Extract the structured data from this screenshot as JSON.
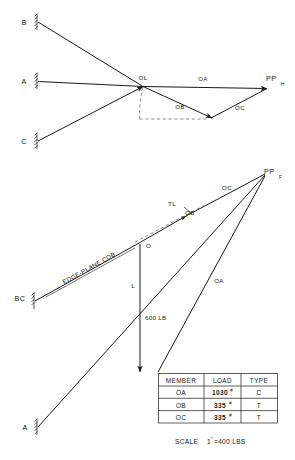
{
  "diagram": {
    "top_view": {
      "name": "horizontal-projection",
      "supports": [
        {
          "id": "support-b",
          "label": "B"
        },
        {
          "id": "support-a",
          "label": "A"
        },
        {
          "id": "support-c",
          "label": "C"
        }
      ],
      "junction_label": "OL",
      "vectors": [
        {
          "id": "vector-oa",
          "label": "OA"
        },
        {
          "id": "vector-ob",
          "label": "OB"
        },
        {
          "id": "vector-oc",
          "label": "OC"
        }
      ],
      "point_label": "PP",
      "point_subscript": "H"
    },
    "bottom_view": {
      "name": "frontal-projection",
      "supports": [
        {
          "id": "support-bc",
          "label": "BC"
        },
        {
          "id": "support-a-lower",
          "label": "A"
        }
      ],
      "edge_plane_label": "EDGE-PLANE COB",
      "origin_label": "O",
      "true_length_label": "TL",
      "vectors": [
        {
          "id": "vector-ob-lower",
          "label": "OB"
        },
        {
          "id": "vector-oc-lower",
          "label": "OC"
        },
        {
          "id": "vector-oa-lower",
          "label": "OA"
        },
        {
          "id": "vector-load",
          "label": "L"
        }
      ],
      "load_label": "600 LB",
      "point_label": "PP",
      "point_subscript": "F"
    }
  },
  "table": {
    "name": "member-load-table",
    "headers": [
      "MEMBER",
      "LOAD",
      "TYPE"
    ],
    "rows": [
      {
        "member": "OA",
        "load": "1030",
        "load_unit": "#",
        "type": "C"
      },
      {
        "member": "OB",
        "load": "335",
        "load_unit": "#",
        "type": "T"
      },
      {
        "member": "OC",
        "load": "335",
        "load_unit": "#",
        "type": "T"
      }
    ]
  },
  "scale": {
    "name": "scale-note",
    "word": "SCALE",
    "value": "1",
    "unit_mark": "\"",
    "equals": "=400 LBS"
  }
}
